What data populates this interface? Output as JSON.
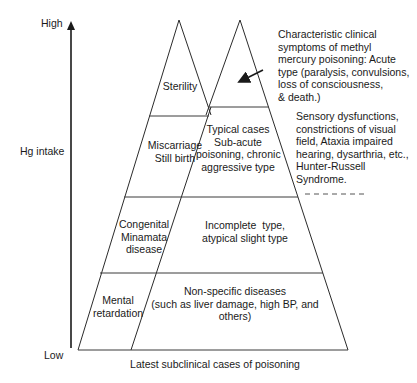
{
  "axis": {
    "high_label": "High",
    "low_label": "Low",
    "title": "Hg intake"
  },
  "x_caption": "Latest subclinical cases of poisoning",
  "left_pyramid": {
    "levels": [
      {
        "label_lines": [
          "Sterility"
        ]
      },
      {
        "label_lines": [
          "Miscarriage",
          "Still birth"
        ]
      },
      {
        "label_lines": [
          "Congenital",
          "Minamata",
          "disease"
        ]
      },
      {
        "label_lines": [
          "Mental",
          "retardation"
        ]
      }
    ]
  },
  "right_pyramid": {
    "levels": [
      {
        "label_lines": []
      },
      {
        "label_lines": [
          "Typical cases",
          "Sub-acute",
          "poisoning, chronic",
          "aggressive type"
        ]
      },
      {
        "label_lines": [
          "Incomplete  type,",
          "atypical slight type"
        ]
      },
      {
        "label_lines": [
          "Non-specific diseases",
          "(such as liver damage, high BP, and",
          "others)"
        ]
      }
    ]
  },
  "annotations": {
    "acute": {
      "lines": [
        "Characteristic clinical",
        "symptoms of methyl",
        "mercury poisoning: Acute",
        "type (paralysis, convulsions,",
        "loss of consciousness,",
        "& death.)"
      ],
      "arrow_icon": "arrow-pointing-left-down"
    },
    "typical_symptoms": {
      "lines": [
        "Sensory dysfunctions,",
        "constrictions of visual",
        "field, Ataxia impaired",
        "hearing, dysarthria, etc.,",
        "Hunter-Russell",
        "Syndrome."
      ]
    }
  },
  "colors": {
    "line": "#2b2b2b",
    "text": "#1a1a1a",
    "background": "#ffffff"
  }
}
